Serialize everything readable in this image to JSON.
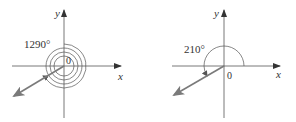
{
  "diagrams": [
    {
      "name": "left",
      "angle_label": "1290°",
      "origin_label": "0",
      "x_label": "x",
      "y_label": "y",
      "rotations": 3,
      "terminal_angle_deg": 210
    },
    {
      "name": "right",
      "angle_label": "210°",
      "origin_label": "0",
      "x_label": "x",
      "y_label": "y",
      "terminal_angle_deg": 210
    }
  ],
  "colors": {
    "axis": "#555555",
    "arc": "#555555",
    "terminal_ray": "#7a7a7a",
    "text": "#333333"
  }
}
